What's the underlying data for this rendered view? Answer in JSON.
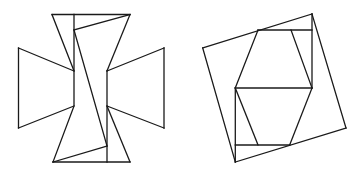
{
  "canvas": {
    "width": 364,
    "height": 175,
    "background": "#ffffff",
    "stroke_color": "#1a1a1a"
  },
  "figures": [
    {
      "name": "cross-dissection",
      "description": "Cross (Maltese-like) shape dissected into pieces",
      "segments": [
        [
          52,
          14.5,
          130,
          14.5
        ],
        [
          52,
          14.5,
          74,
          71
        ],
        [
          130,
          14.5,
          107,
          71
        ],
        [
          74,
          14.5,
          74,
          105
        ],
        [
          74,
          30,
          130,
          14.5
        ],
        [
          74,
          30,
          107,
          146
        ],
        [
          18.5,
          48,
          74,
          71
        ],
        [
          18.5,
          48,
          18.5,
          128
        ],
        [
          18.5,
          128,
          74,
          106
        ],
        [
          164,
          48,
          107,
          71
        ],
        [
          164,
          48,
          164,
          128
        ],
        [
          164,
          128,
          107,
          106
        ],
        [
          107,
          71,
          107,
          162
        ],
        [
          74,
          106,
          53,
          162
        ],
        [
          107,
          106,
          130,
          162
        ],
        [
          53,
          162,
          107,
          146
        ],
        [
          53,
          162,
          130,
          162
        ]
      ]
    },
    {
      "name": "square-dissection",
      "description": "Tilted square containing rearranged pieces forming a hexagon",
      "segments": [
        [
          312,
          14,
          202.7,
          48
        ],
        [
          202.7,
          48,
          235.3,
          162
        ],
        [
          235.3,
          162,
          346,
          128
        ],
        [
          346,
          128,
          312,
          14
        ],
        [
          258,
          30,
          312,
          30
        ],
        [
          312,
          14,
          312,
          88
        ],
        [
          258,
          30,
          235.3,
          88
        ],
        [
          291,
          30,
          312,
          88
        ],
        [
          235.3,
          88,
          312,
          88
        ],
        [
          235.3,
          88,
          235.3,
          162
        ],
        [
          235.3,
          88,
          258,
          145
        ],
        [
          312,
          88,
          289.7,
          145
        ],
        [
          235.3,
          145,
          289.7,
          145
        ]
      ]
    }
  ]
}
